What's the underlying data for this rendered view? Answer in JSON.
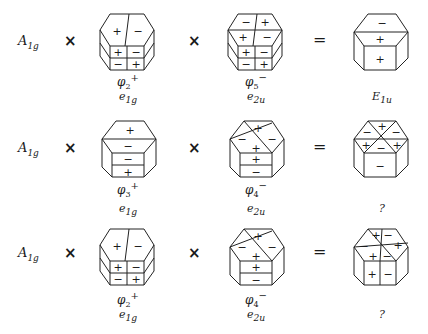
{
  "rows": [
    {
      "lhs": {
        "symbol": "A",
        "sub": "1g"
      },
      "op1": "×",
      "f1": {
        "phi": "φ",
        "phi_sub": "2",
        "phi_sup": "+",
        "irrep": "e",
        "irrep_sub": "1g"
      },
      "op2": "×",
      "f2": {
        "phi": "φ",
        "phi_sub": "5",
        "phi_sup": "−",
        "irrep": "e",
        "irrep_sub": "2u"
      },
      "eq": "=",
      "result": {
        "symbol": "E",
        "sub": "1u"
      }
    },
    {
      "lhs": {
        "symbol": "A",
        "sub": "1g"
      },
      "op1": "×",
      "f1": {
        "phi": "φ",
        "phi_sub": "3",
        "phi_sup": "+",
        "irrep": "e",
        "irrep_sub": "1g"
      },
      "op2": "×",
      "f2": {
        "phi": "φ",
        "phi_sub": "4",
        "phi_sup": "−",
        "irrep": "e",
        "irrep_sub": "2u"
      },
      "eq": "=",
      "result": {
        "symbol": "?",
        "sub": ""
      }
    },
    {
      "lhs": {
        "symbol": "A",
        "sub": "1g"
      },
      "op1": "×",
      "f1": {
        "phi": "φ",
        "phi_sub": "2",
        "phi_sup": "+",
        "irrep": "e",
        "irrep_sub": "1g"
      },
      "op2": "×",
      "f2": {
        "phi": "φ",
        "phi_sub": "4",
        "phi_sup": "−",
        "irrep": "e",
        "irrep_sub": "2u"
      },
      "eq": "=",
      "result": {
        "symbol": "?",
        "sub": ""
      }
    }
  ],
  "signs": {
    "r1_f1": {
      "top": [
        "+",
        "−"
      ],
      "side": [
        [
          "+",
          "−"
        ],
        [
          "−",
          "+"
        ]
      ]
    },
    "r1_f2": {
      "top": [
        "−",
        "+",
        "+",
        "−"
      ],
      "side": [
        [
          "+",
          "−"
        ],
        [
          "−",
          "+"
        ]
      ]
    },
    "r1_res": {
      "top": [
        "−",
        "+"
      ],
      "side": [
        "+"
      ]
    },
    "r2_f1": {
      "top": [
        "+",
        "−"
      ],
      "side": [
        "−",
        "+"
      ]
    },
    "r2_f2": {
      "top": [
        "+",
        "−",
        "−",
        "+"
      ],
      "side": [
        "+",
        "−"
      ]
    },
    "r2_res": {
      "top": [
        "+",
        "−",
        "−",
        "+",
        "+",
        "−"
      ],
      "side": [
        "−"
      ]
    },
    "r3_f1": {
      "top": [
        "+",
        "−"
      ],
      "side": [
        [
          "+",
          "−"
        ],
        [
          "−",
          "+"
        ]
      ]
    },
    "r3_f2": {
      "top": [
        "+",
        "−",
        "−",
        "+"
      ],
      "side": [
        "+",
        "−"
      ]
    },
    "r3_res": {
      "top": [
        "+",
        "−",
        "−",
        "+",
        "+",
        "−"
      ],
      "side": [
        "+",
        "−"
      ]
    }
  }
}
